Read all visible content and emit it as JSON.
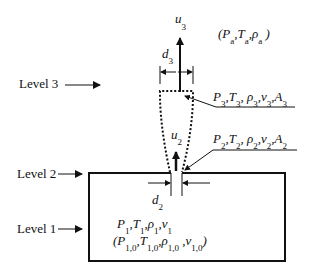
{
  "levels": {
    "level3": "Level 3",
    "level2": "Level 2",
    "level1": "Level 1"
  },
  "ambient": {
    "open": "(",
    "P": "P",
    "P_sub": "a",
    "T": "T",
    "T_sub": "a",
    "rho": "ρ",
    "rho_sub": "a",
    "close": ")"
  },
  "velocity3": {
    "sym": "u",
    "sub": "3"
  },
  "velocity2": {
    "sym": "u",
    "sub": "2"
  },
  "diameter3": {
    "sym": "d",
    "sub": "3"
  },
  "diameter2": {
    "sym": "d",
    "sub": "2"
  },
  "state3": {
    "P": "P",
    "T": "T",
    "rho": "ρ",
    "v": "v",
    "A": "A",
    "sub": "3",
    "sep": ","
  },
  "state2": {
    "P": "P",
    "T": "T",
    "rho": "ρ",
    "v": "v",
    "A": "A",
    "sub": "2",
    "sep": ","
  },
  "state1": {
    "P": "P",
    "T": "T",
    "rho": "ρ",
    "v": "v",
    "sub": "1",
    "sep": ","
  },
  "state1_initial": {
    "open": "(",
    "P": "P",
    "T": "T",
    "rho": "ρ",
    "v": "v",
    "sub": "1,0",
    "close": ")",
    "sep": ","
  },
  "colors": {
    "line": "#111111",
    "background": "#ffffff"
  }
}
